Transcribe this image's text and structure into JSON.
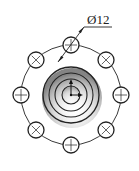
{
  "diagram": {
    "type": "technical-drawing-top-view",
    "dimension_label": "Ø12",
    "bolt_circle": {
      "cx": 71,
      "cy": 95,
      "r": 50
    },
    "holes": {
      "count": 8,
      "radius": 8,
      "positions": [
        {
          "cx": 71,
          "cy": 45
        },
        {
          "cx": 106,
          "cy": 60
        },
        {
          "cx": 121,
          "cy": 95
        },
        {
          "cx": 106,
          "cy": 130
        },
        {
          "cx": 71,
          "cy": 145
        },
        {
          "cx": 36,
          "cy": 130
        },
        {
          "cx": 21,
          "cy": 95
        },
        {
          "cx": 36,
          "cy": 60
        }
      ]
    },
    "boss_rings": [
      28,
      22,
      16,
      9
    ],
    "colors": {
      "line": "#222222",
      "shadow": "#9a9a9a"
    }
  }
}
